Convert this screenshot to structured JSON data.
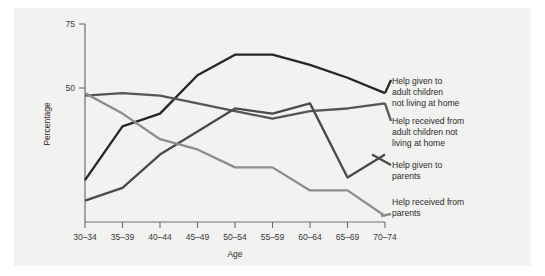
{
  "figure": {
    "background_color": "#f2f2f0",
    "page_color": "#ffffff",
    "axis_color": "#6e6e6e"
  },
  "axes": {
    "x_title": "Age",
    "y_title": "Percentage",
    "y_ticks": [
      "50",
      "75"
    ],
    "x_ticks": [
      "30–34",
      "35–39",
      "40–44",
      "45–49",
      "50–54",
      "55–59",
      "60–64",
      "65–69",
      "70–74"
    ]
  },
  "legend": {
    "items": [
      {
        "label_lines": [
          "Help given to",
          "adult children",
          "not living at home"
        ],
        "color": "#262626"
      },
      {
        "label_lines": [
          "Help received from",
          "adult children not",
          "living at home"
        ],
        "color": "#555555"
      },
      {
        "label_lines": [
          "Help given to",
          "parents"
        ],
        "color": "#4a4a4a"
      },
      {
        "label_lines": [
          "Help received from",
          "parents"
        ],
        "color": "#8d8d8d"
      }
    ]
  },
  "chart_data": {
    "type": "line",
    "title": "",
    "subtitle": "",
    "xlabel": "Age",
    "ylabel": "Percentage",
    "categories": [
      "30–34",
      "35–39",
      "40–44",
      "45–49",
      "50–54",
      "55–59",
      "60–64",
      "65–69",
      "70–74"
    ],
    "ylim": [
      0,
      75
    ],
    "yticks": [
      50,
      75
    ],
    "grid": false,
    "legend_position": "right",
    "series": [
      {
        "name": "Help given to adult children not living at home",
        "color": "#262626",
        "values": [
          14,
          35,
          40,
          55,
          63,
          63,
          59,
          54,
          48
        ]
      },
      {
        "name": "Help received from adult children not living at home",
        "color": "#555555",
        "values": [
          47,
          48,
          47,
          44,
          41,
          38,
          41,
          42,
          44
        ]
      },
      {
        "name": "Help given to parents",
        "color": "#4a4a4a",
        "values": [
          6,
          11,
          24,
          33,
          42,
          40,
          44,
          15,
          24
        ]
      },
      {
        "name": "Help received from parents",
        "color": "#8d8d8d",
        "values": [
          48,
          40,
          30,
          26,
          19,
          19,
          10,
          10,
          0
        ]
      }
    ]
  }
}
